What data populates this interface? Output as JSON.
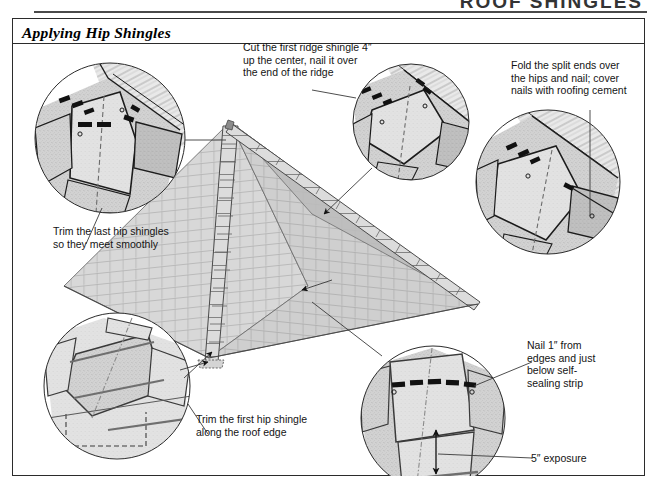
{
  "page": {
    "running_head": "ROOF SHINGLES",
    "figure_title": "Applying Hip Shingles"
  },
  "captions": {
    "top_center": "Cut the first ridge shingle 4″\nup the center, nail it over\nthe end of the ridge",
    "top_right": "Fold the split ends over\nthe hips and nail; cover\nnails with roofing cement",
    "left": "Trim the last hip shingles\nso they meet smoothly",
    "bottom_middle": "Trim the first hip shingle\nalong the roof edge",
    "bottom_right": "Nail 1″ from\nedges and just\nbelow self-\nsealing strip",
    "exposure": "5″ exposure"
  },
  "details": {
    "inset_top_left": "trim-last-hip-shingles-detail",
    "inset_top_center": "ridge-shingle-over-end-detail",
    "inset_right": "fold-split-ends-detail",
    "inset_bottom_left": "trim-first-hip-shingle-detail",
    "inset_bottom_right": "nailing-and-exposure-detail",
    "main_illustration": "hip-roof-pyramid-with-shingle-courses"
  },
  "colors": {
    "ink": "#1a1a1a",
    "rule": "#2b2b2b",
    "shingle_fill": "#cdcdcd",
    "shingle_fill_light": "#e0e0e0",
    "shingle_fill_dark": "#b4b4b4",
    "nail_mark": "#111111",
    "paper": "#ffffff"
  }
}
